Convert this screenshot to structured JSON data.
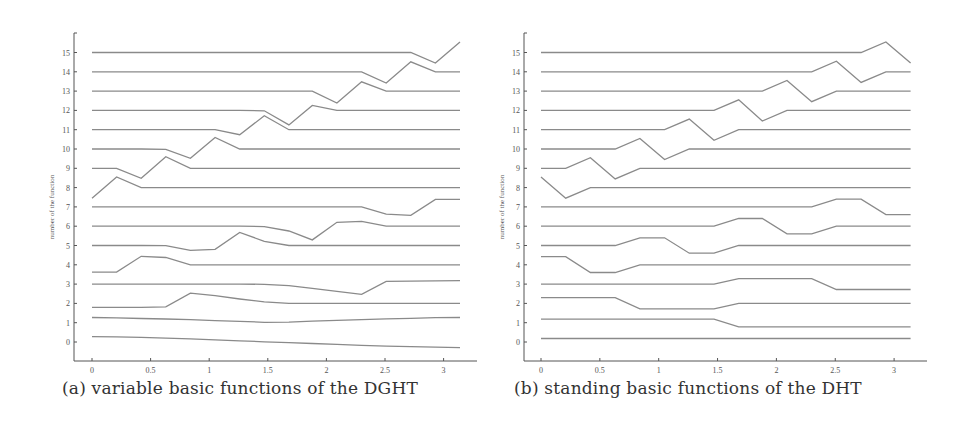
{
  "chart_data": [
    {
      "id": "a",
      "type": "line",
      "title": "(a) variable basic functions of the DGHT",
      "caption": "(a) variable basic functions of the DGHT",
      "xlabel": "",
      "ylabel": "number of the function",
      "xlim": [
        -0.15,
        3.45
      ],
      "ylim": [
        -1,
        16
      ],
      "xticks": [
        0,
        0.5,
        1,
        1.5,
        2,
        2.5,
        3
      ],
      "xtick_labels": [
        "0",
        "0.5",
        "1",
        "1.5",
        "2",
        "2.5",
        "3"
      ],
      "yticks": [
        0,
        1,
        2,
        3,
        4,
        5,
        6,
        7,
        8,
        9,
        10,
        11,
        12,
        13,
        14,
        15
      ],
      "ytick_labels": [
        "0",
        "1",
        "2",
        "3",
        "4",
        "5",
        "6",
        "7",
        "8",
        "9",
        "10",
        "11",
        "12",
        "13",
        "14",
        "15"
      ],
      "grid": false,
      "legend": "none",
      "x": [
        0,
        0.21,
        0.42,
        0.63,
        0.84,
        1.05,
        1.26,
        1.47,
        1.68,
        1.88,
        2.09,
        2.3,
        2.51,
        2.72,
        2.93,
        3.14
      ],
      "series": [
        {
          "name": "0",
          "values": [
            0.28,
            0.27,
            0.24,
            0.2,
            0.16,
            0.11,
            0.06,
            0.01,
            -0.03,
            -0.08,
            -0.12,
            -0.17,
            -0.21,
            -0.24,
            -0.27,
            -0.29
          ]
        },
        {
          "name": "1",
          "values": [
            1.27,
            1.25,
            1.22,
            1.19,
            1.16,
            1.11,
            1.07,
            1.02,
            1.03,
            1.08,
            1.12,
            1.16,
            1.2,
            1.23,
            1.26,
            1.27
          ]
        },
        {
          "name": "2",
          "values": [
            1.8,
            1.8,
            1.8,
            1.82,
            2.53,
            2.4,
            2.23,
            2.08,
            2.0,
            2.0,
            2.0,
            2.0,
            2.0,
            2.0,
            2.0,
            2.0
          ]
        },
        {
          "name": "3",
          "values": [
            3.0,
            3.0,
            3.0,
            3.0,
            3.0,
            3.0,
            3.0,
            2.99,
            2.92,
            2.78,
            2.62,
            2.47,
            3.14,
            3.15,
            3.17,
            3.18
          ]
        },
        {
          "name": "4",
          "values": [
            3.62,
            3.62,
            4.44,
            4.38,
            4.0,
            4.0,
            4.0,
            4.0,
            4.0,
            4.0,
            4.0,
            4.0,
            4.0,
            4.0,
            4.0,
            4.0
          ]
        },
        {
          "name": "5",
          "values": [
            5.0,
            5.0,
            5.0,
            4.99,
            4.75,
            4.8,
            5.68,
            5.22,
            5.0,
            5.0,
            5.0,
            5.0,
            5.0,
            5.0,
            5.0,
            5.0
          ]
        },
        {
          "name": "6",
          "values": [
            6.0,
            6.0,
            6.0,
            6.0,
            6.0,
            6.0,
            6.0,
            5.98,
            5.75,
            5.29,
            6.2,
            6.25,
            6.0,
            6.0,
            6.0,
            6.0
          ]
        },
        {
          "name": "7",
          "values": [
            7.0,
            7.0,
            7.0,
            7.0,
            7.0,
            7.0,
            7.0,
            7.0,
            7.0,
            7.0,
            7.0,
            7.0,
            6.62,
            6.56,
            7.39,
            7.39
          ]
        },
        {
          "name": "8",
          "values": [
            7.45,
            8.55,
            8.0,
            8.0,
            8.0,
            8.0,
            8.0,
            8.0,
            8.0,
            8.0,
            8.0,
            8.0,
            8.0,
            8.0,
            8.0,
            8.0
          ]
        },
        {
          "name": "9",
          "values": [
            9.0,
            9.0,
            8.48,
            9.6,
            9.0,
            9.0,
            9.0,
            9.0,
            9.0,
            9.0,
            9.0,
            9.0,
            9.0,
            9.0,
            9.0,
            9.0
          ]
        },
        {
          "name": "10",
          "values": [
            10.0,
            10.0,
            10.0,
            9.98,
            9.52,
            10.6,
            10.0,
            10.0,
            10.0,
            10.0,
            10.0,
            10.0,
            10.0,
            10.0,
            10.0,
            10.0
          ]
        },
        {
          "name": "11",
          "values": [
            11.0,
            11.0,
            11.0,
            11.0,
            11.0,
            11.0,
            10.74,
            11.72,
            11.0,
            11.0,
            11.0,
            11.0,
            11.0,
            11.0,
            11.0,
            11.0
          ]
        },
        {
          "name": "12",
          "values": [
            12.0,
            12.0,
            12.0,
            12.0,
            12.0,
            12.0,
            12.0,
            11.98,
            11.25,
            12.26,
            12.0,
            12.0,
            12.0,
            12.0,
            12.0,
            12.0
          ]
        },
        {
          "name": "13",
          "values": [
            13.0,
            13.0,
            13.0,
            13.0,
            13.0,
            13.0,
            13.0,
            13.0,
            13.0,
            13.0,
            12.38,
            13.48,
            13.0,
            13.0,
            13.0,
            13.0
          ]
        },
        {
          "name": "14",
          "values": [
            14.0,
            14.0,
            14.0,
            14.0,
            14.0,
            14.0,
            14.0,
            14.0,
            14.0,
            14.0,
            14.0,
            14.0,
            13.42,
            14.52,
            14.0,
            14.0
          ]
        },
        {
          "name": "15",
          "values": [
            15.0,
            15.0,
            15.0,
            15.0,
            15.0,
            15.0,
            15.0,
            15.0,
            15.0,
            15.0,
            15.0,
            15.0,
            15.0,
            15.0,
            14.45,
            15.55
          ]
        }
      ]
    },
    {
      "id": "b",
      "type": "line",
      "title": "(b) standing basic functions of the DHT",
      "caption": "(b) standing basic functions of the DHT",
      "xlabel": "",
      "ylabel": "number of the function",
      "xlim": [
        -0.15,
        3.45
      ],
      "ylim": [
        -1,
        16
      ],
      "xticks": [
        0,
        0.5,
        1,
        1.5,
        2,
        2.5,
        3
      ],
      "xtick_labels": [
        "0",
        "0.5",
        "1",
        "1.5",
        "2",
        "2.5",
        "3"
      ],
      "yticks": [
        0,
        1,
        2,
        3,
        4,
        5,
        6,
        7,
        8,
        9,
        10,
        11,
        12,
        13,
        14,
        15
      ],
      "ytick_labels": [
        "0",
        "1",
        "2",
        "3",
        "4",
        "5",
        "6",
        "7",
        "8",
        "9",
        "10",
        "11",
        "12",
        "13",
        "14",
        "15"
      ],
      "grid": false,
      "legend": "none",
      "x": [
        0,
        0.21,
        0.42,
        0.63,
        0.84,
        1.05,
        1.26,
        1.47,
        1.68,
        1.88,
        2.09,
        2.3,
        2.51,
        2.72,
        2.93,
        3.14
      ],
      "series": [
        {
          "name": "0",
          "values": [
            0.18,
            0.18,
            0.18,
            0.18,
            0.18,
            0.18,
            0.18,
            0.18,
            0.18,
            0.18,
            0.18,
            0.18,
            0.18,
            0.18,
            0.18,
            0.18
          ]
        },
        {
          "name": "1",
          "values": [
            1.18,
            1.18,
            1.18,
            1.18,
            1.18,
            1.18,
            1.18,
            1.18,
            0.78,
            0.78,
            0.78,
            0.78,
            0.78,
            0.78,
            0.78,
            0.78
          ]
        },
        {
          "name": "2",
          "values": [
            2.3,
            2.3,
            2.3,
            2.3,
            1.72,
            1.72,
            1.72,
            1.72,
            2.0,
            2.0,
            2.0,
            2.0,
            2.0,
            2.0,
            2.0,
            2.0
          ]
        },
        {
          "name": "3",
          "values": [
            3.0,
            3.0,
            3.0,
            3.0,
            3.0,
            3.0,
            3.0,
            3.0,
            3.28,
            3.28,
            3.28,
            3.28,
            2.72,
            2.72,
            2.72,
            2.72
          ]
        },
        {
          "name": "4",
          "values": [
            4.42,
            4.42,
            3.6,
            3.6,
            4.0,
            4.0,
            4.0,
            4.0,
            4.0,
            4.0,
            4.0,
            4.0,
            4.0,
            4.0,
            4.0,
            4.0
          ]
        },
        {
          "name": "5",
          "values": [
            5.0,
            5.0,
            5.0,
            5.0,
            5.4,
            5.4,
            4.6,
            4.6,
            5.0,
            5.0,
            5.0,
            5.0,
            5.0,
            5.0,
            5.0,
            5.0
          ]
        },
        {
          "name": "6",
          "values": [
            6.0,
            6.0,
            6.0,
            6.0,
            6.0,
            6.0,
            6.0,
            6.0,
            6.4,
            6.4,
            5.6,
            5.6,
            6.0,
            6.0,
            6.0,
            6.0
          ]
        },
        {
          "name": "7",
          "values": [
            7.0,
            7.0,
            7.0,
            7.0,
            7.0,
            7.0,
            7.0,
            7.0,
            7.0,
            7.0,
            7.0,
            7.0,
            7.4,
            7.4,
            6.6,
            6.6
          ]
        },
        {
          "name": "8",
          "values": [
            8.55,
            7.45,
            8.0,
            8.0,
            8.0,
            8.0,
            8.0,
            8.0,
            8.0,
            8.0,
            8.0,
            8.0,
            8.0,
            8.0,
            8.0,
            8.0
          ]
        },
        {
          "name": "9",
          "values": [
            9.0,
            9.0,
            9.55,
            8.45,
            9.0,
            9.0,
            9.0,
            9.0,
            9.0,
            9.0,
            9.0,
            9.0,
            9.0,
            9.0,
            9.0,
            9.0
          ]
        },
        {
          "name": "10",
          "values": [
            10.0,
            10.0,
            10.0,
            10.0,
            10.55,
            9.45,
            10.0,
            10.0,
            10.0,
            10.0,
            10.0,
            10.0,
            10.0,
            10.0,
            10.0,
            10.0
          ]
        },
        {
          "name": "11",
          "values": [
            11.0,
            11.0,
            11.0,
            11.0,
            11.0,
            11.0,
            11.55,
            10.45,
            11.0,
            11.0,
            11.0,
            11.0,
            11.0,
            11.0,
            11.0,
            11.0
          ]
        },
        {
          "name": "12",
          "values": [
            12.0,
            12.0,
            12.0,
            12.0,
            12.0,
            12.0,
            12.0,
            12.0,
            12.55,
            11.45,
            12.0,
            12.0,
            12.0,
            12.0,
            12.0,
            12.0
          ]
        },
        {
          "name": "13",
          "values": [
            13.0,
            13.0,
            13.0,
            13.0,
            13.0,
            13.0,
            13.0,
            13.0,
            13.0,
            13.0,
            13.55,
            12.45,
            13.0,
            13.0,
            13.0,
            13.0
          ]
        },
        {
          "name": "14",
          "values": [
            14.0,
            14.0,
            14.0,
            14.0,
            14.0,
            14.0,
            14.0,
            14.0,
            14.0,
            14.0,
            14.0,
            14.0,
            14.55,
            13.45,
            14.0,
            14.0
          ]
        },
        {
          "name": "15",
          "values": [
            15.0,
            15.0,
            15.0,
            15.0,
            15.0,
            15.0,
            15.0,
            15.0,
            15.0,
            15.0,
            15.0,
            15.0,
            15.0,
            15.0,
            15.55,
            14.45
          ]
        }
      ]
    }
  ],
  "colors": {
    "line": "#8a8a8a",
    "axis": "#555555",
    "text": "#333333",
    "background": "#ffffff"
  }
}
